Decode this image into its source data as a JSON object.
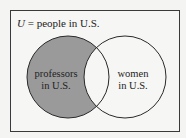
{
  "diagram": {
    "universe_label_var": "U",
    "universe_label_rest": " = people in U.S.",
    "sets": [
      {
        "line1": "professors",
        "line2": "in U.S.",
        "shaded": true
      },
      {
        "line1": "women",
        "line2": "in U.S.",
        "shaded": false
      }
    ],
    "colors": {
      "shade": "#9a9a9a",
      "stroke": "#2a2a2a",
      "background": "#f6f6f4"
    }
  }
}
